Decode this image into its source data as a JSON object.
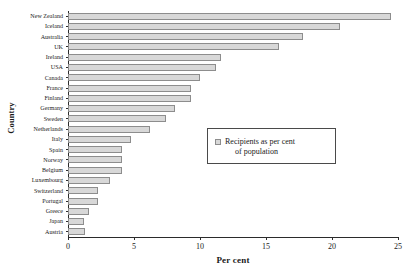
{
  "chart_data": {
    "type": "bar",
    "orientation": "horizontal",
    "title": "",
    "xlabel": "Per cent",
    "ylabel": "Country",
    "xlim": [
      0,
      25
    ],
    "xticks": [
      0,
      5,
      10,
      15,
      20,
      25
    ],
    "grid": false,
    "legend": {
      "position": "inside-right",
      "entries": [
        {
          "label_line1": "Recipients as per cent",
          "label_line2": "of population",
          "label": "Recipients as per cent of population",
          "color": "#d8d8d8"
        }
      ]
    },
    "categories": [
      "New Zealand",
      "Iceland",
      "Australia",
      "UK",
      "Ireland",
      "USA",
      "Canada",
      "France",
      "Finland",
      "Germany",
      "Sweden",
      "Netherlands",
      "Italy",
      "Spain",
      "Norway",
      "Belgium",
      "Luxembourg",
      "Switzerland",
      "Portugal",
      "Greece",
      "Japan",
      "Austria"
    ],
    "values": [
      24.5,
      20.6,
      17.8,
      16.0,
      11.6,
      11.2,
      10.0,
      9.3,
      9.3,
      8.1,
      7.4,
      6.2,
      4.8,
      4.1,
      4.1,
      4.1,
      3.2,
      2.3,
      2.3,
      1.6,
      1.2,
      1.3
    ],
    "series_name": "Recipients as per cent of population",
    "bar_color": "#d8d8d8",
    "bar_border_color": "#8d8d8d",
    "axis_color": "#2b2b2b"
  }
}
